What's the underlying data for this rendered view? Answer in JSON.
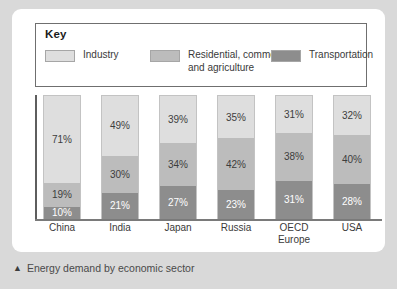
{
  "caption": {
    "marker": "▲",
    "text": "Energy demand by economic sector"
  },
  "legend": {
    "title": "Key",
    "items": [
      {
        "label": "Industry",
        "color": "#dedede",
        "key": "industry"
      },
      {
        "label": "Residential, commercial\nand agriculture",
        "color": "#bcbcbc",
        "key": "residential"
      },
      {
        "label": "Transportation",
        "color": "#8d8d8d",
        "key": "transportation"
      }
    ]
  },
  "chart_data": {
    "type": "bar",
    "subtype": "stacked-100-percent",
    "title": "Energy demand by economic sector",
    "xlabel": "",
    "ylabel": "",
    "ylim": [
      0,
      100
    ],
    "grid": false,
    "legend_position": "top",
    "categories": [
      "China",
      "India",
      "Japan",
      "Russia",
      "OECD\nEurope",
      "USA"
    ],
    "series": [
      {
        "name": "Industry",
        "color": "#dedede",
        "values": [
          71,
          49,
          39,
          35,
          31,
          32
        ]
      },
      {
        "name": "Residential, commercial and agriculture",
        "color": "#bcbcbc",
        "values": [
          19,
          30,
          34,
          42,
          38,
          40
        ]
      },
      {
        "name": "Transportation",
        "color": "#8d8d8d",
        "values": [
          10,
          21,
          27,
          23,
          31,
          28
        ]
      }
    ],
    "bars": [
      {
        "category": "China",
        "label": "China",
        "segments": [
          {
            "series": "Industry",
            "value": 71,
            "label": "71%"
          },
          {
            "series": "Residential, commercial and agriculture",
            "value": 19,
            "label": "19%"
          },
          {
            "series": "Transportation",
            "value": 10,
            "label": "10%"
          }
        ]
      },
      {
        "category": "India",
        "label": "India",
        "segments": [
          {
            "series": "Industry",
            "value": 49,
            "label": "49%"
          },
          {
            "series": "Residential, commercial and agriculture",
            "value": 30,
            "label": "30%"
          },
          {
            "series": "Transportation",
            "value": 21,
            "label": "21%"
          }
        ]
      },
      {
        "category": "Japan",
        "label": "Japan",
        "segments": [
          {
            "series": "Industry",
            "value": 39,
            "label": "39%"
          },
          {
            "series": "Residential, commercial and agriculture",
            "value": 34,
            "label": "34%"
          },
          {
            "series": "Transportation",
            "value": 27,
            "label": "27%"
          }
        ]
      },
      {
        "category": "Russia",
        "label": "Russia",
        "segments": [
          {
            "series": "Industry",
            "value": 35,
            "label": "35%"
          },
          {
            "series": "Residential, commercial and agriculture",
            "value": 42,
            "label": "42%"
          },
          {
            "series": "Transportation",
            "value": 23,
            "label": "23%"
          }
        ]
      },
      {
        "category": "OECD Europe",
        "label": "OECD\nEurope",
        "segments": [
          {
            "series": "Industry",
            "value": 31,
            "label": "31%"
          },
          {
            "series": "Residential, commercial and agriculture",
            "value": 38,
            "label": "38%"
          },
          {
            "series": "Transportation",
            "value": 31,
            "label": "31%"
          }
        ]
      },
      {
        "category": "USA",
        "label": "USA",
        "segments": [
          {
            "series": "Industry",
            "value": 32,
            "label": "32%"
          },
          {
            "series": "Residential, commercial and agriculture",
            "value": 40,
            "label": "40%"
          },
          {
            "series": "Transportation",
            "value": 28,
            "label": "28%"
          }
        ]
      }
    ]
  },
  "colors": {
    "page_background": "#d9d9d9",
    "card_background": "#ffffff",
    "axis": "#5e5e5e",
    "industry": "#dedede",
    "residential": "#bcbcbc",
    "transportation": "#8d8d8d"
  }
}
